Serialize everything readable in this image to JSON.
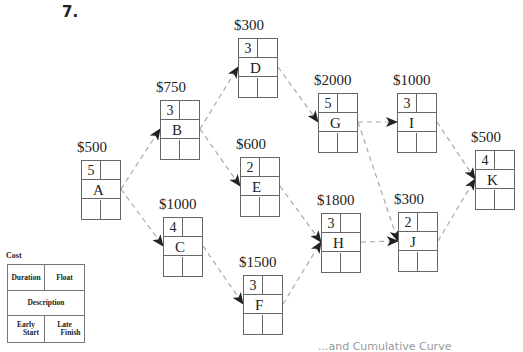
{
  "problem_number": "7.",
  "nodes": {
    "A": {
      "cost": "$500",
      "duration": "5",
      "label": "A",
      "x": 81,
      "y": 160
    },
    "B": {
      "cost": "$750",
      "duration": "3",
      "label": "B",
      "x": 160,
      "y": 100
    },
    "C": {
      "cost": "$1000",
      "duration": "4",
      "label": "C",
      "x": 163,
      "y": 217
    },
    "D": {
      "cost": "$300",
      "duration": "3",
      "label": "D",
      "x": 238,
      "y": 38
    },
    "E": {
      "cost": "$600",
      "duration": "2",
      "label": "E",
      "x": 240,
      "y": 157
    },
    "F": {
      "cost": "$1500",
      "duration": "3",
      "label": "F",
      "x": 243,
      "y": 275
    },
    "G": {
      "cost": "$2000",
      "duration": "5",
      "label": "G",
      "x": 318,
      "y": 93
    },
    "H": {
      "cost": "$1800",
      "duration": "3",
      "label": "H",
      "x": 321,
      "y": 213
    },
    "I": {
      "cost": "$1000",
      "duration": "3",
      "label": "I",
      "x": 397,
      "y": 93
    },
    "J": {
      "cost": "$300",
      "duration": "2",
      "label": "J",
      "x": 398,
      "y": 212
    },
    "K": {
      "cost": "$500",
      "duration": "4",
      "label": "K",
      "x": 475,
      "y": 150
    }
  },
  "edges": [
    [
      "A",
      "B"
    ],
    [
      "A",
      "C"
    ],
    [
      "B",
      "D"
    ],
    [
      "B",
      "E"
    ],
    [
      "C",
      "F"
    ],
    [
      "D",
      "G"
    ],
    [
      "E",
      "H"
    ],
    [
      "F",
      "H"
    ],
    [
      "G",
      "I"
    ],
    [
      "G",
      "J"
    ],
    [
      "H",
      "J"
    ],
    [
      "I",
      "K"
    ],
    [
      "J",
      "K"
    ]
  ],
  "legend": {
    "title": "Cost",
    "duration": "Duration",
    "float": "Float",
    "description": "Description",
    "early_start_1": "Early",
    "early_start_2": "Start",
    "late_finish_1": "Late",
    "late_finish_2": "Finish"
  },
  "caption": "...and Cumulative Curve",
  "colors": {
    "edge": "#aaaaaa",
    "arrowhead": "#222222",
    "box_border": "#666666"
  }
}
